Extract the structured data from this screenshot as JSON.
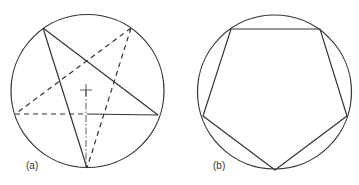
{
  "figure": {
    "panels": [
      {
        "label": "(a)",
        "description": "Construction of a regular pentagon inscribed in a circle: star construction lines (solid and dashed) with center mark and dash-dot center line",
        "circle": {
          "cx": 87.5,
          "cy": 91,
          "r": 76.5
        },
        "center_mark": {
          "x": 86,
          "y": 90,
          "size": 6
        },
        "points": {
          "top_left": [
            43,
            28
          ],
          "top_right": [
            131,
            28
          ],
          "left": [
            17,
            113
          ],
          "right": [
            158,
            115
          ],
          "bottom": [
            87,
            168
          ]
        },
        "solid_lines": [
          [
            [
              43,
              28
            ],
            [
              87,
              168
            ]
          ],
          [
            [
              43,
              28
            ],
            [
              158,
              115
            ]
          ],
          [
            [
              87,
              114
            ],
            [
              158,
              115
            ]
          ]
        ],
        "dashed_lines": [
          [
            [
              131,
              28
            ],
            [
              18,
              112
            ]
          ],
          [
            [
              131,
              28
            ],
            [
              87,
              168
            ]
          ],
          [
            [
              15,
              114
            ],
            [
              87,
              114
            ]
          ]
        ],
        "center_line": [
          [
            86,
            90
          ],
          [
            86,
            168
          ]
        ]
      },
      {
        "label": "(b)",
        "description": "Regular pentagon inscribed in a circle (point-down orientation)",
        "circle": {
          "cx": 274.5,
          "cy": 92,
          "r": 77
        },
        "pentagon": [
          [
            231,
            29
          ],
          [
            320,
            29
          ],
          [
            347,
            116
          ],
          [
            275,
            170
          ],
          [
            203,
            116
          ]
        ]
      }
    ],
    "stroke_color": "#333333"
  }
}
